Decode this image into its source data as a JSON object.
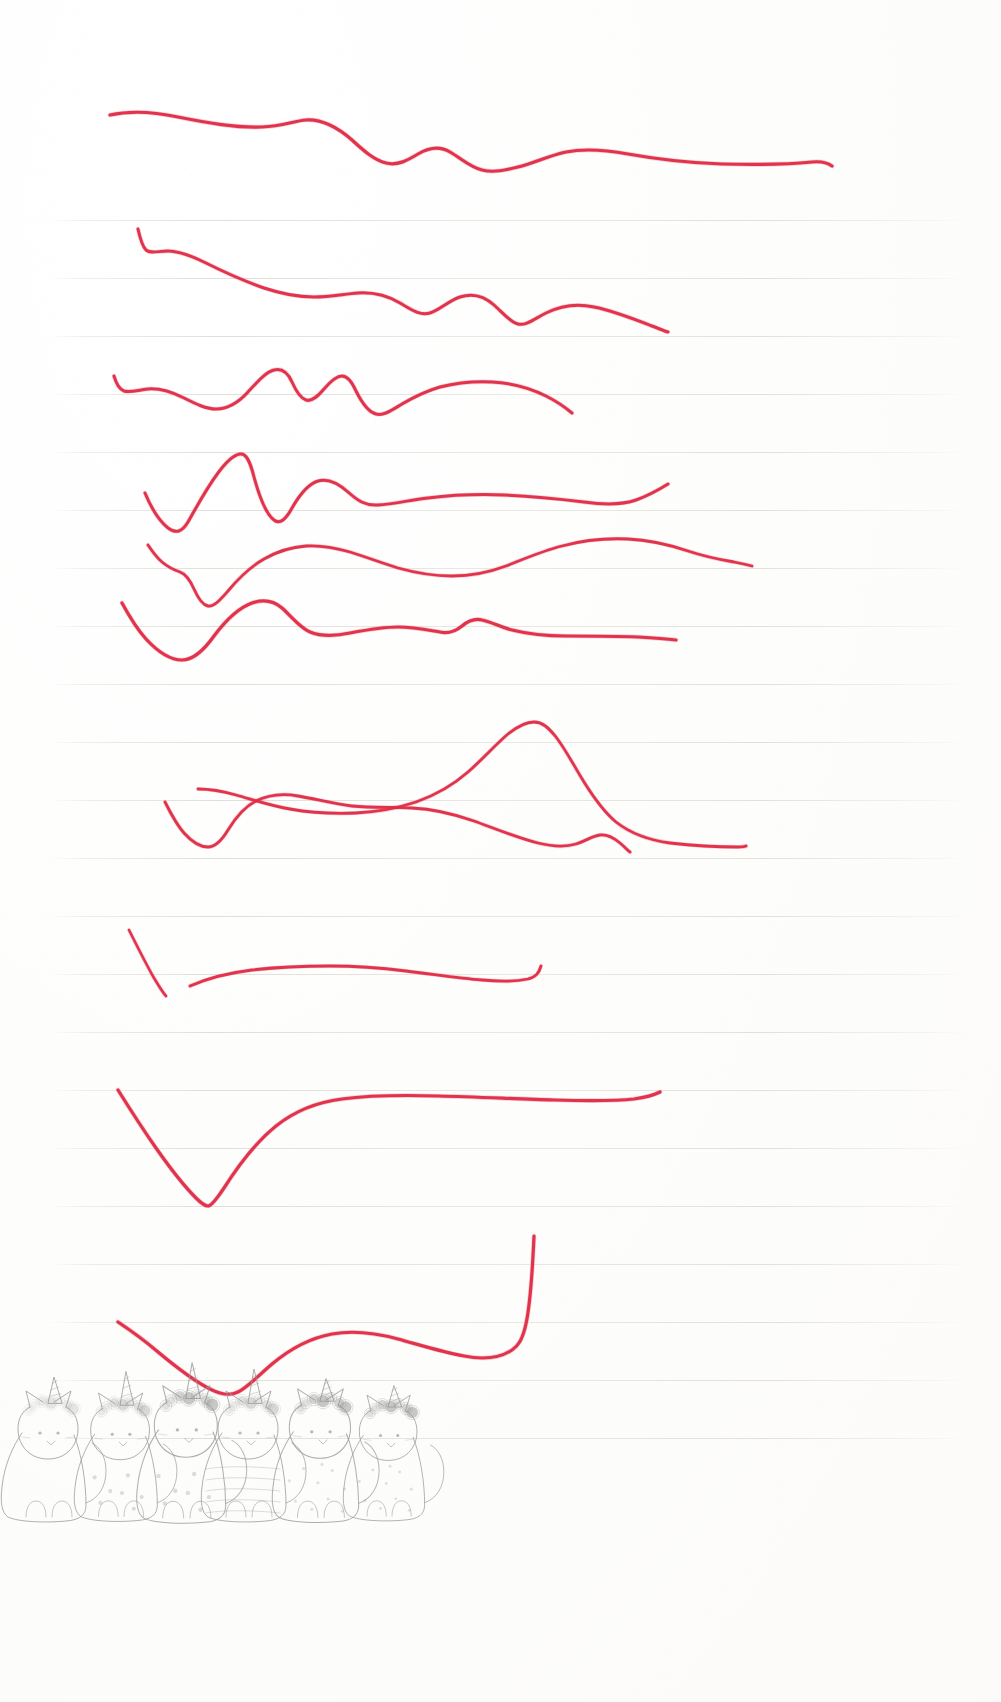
{
  "page": {
    "width": 1001,
    "height": 1702,
    "background_color": "#fefefe",
    "medium": "scanned lined notebook paper",
    "ink_color": "#e02a46",
    "ink_color_light": "#e8566c",
    "pencil_color": "#8e8e8e",
    "rule_color": "#c8c4b9"
  },
  "ruled_lines": {
    "count": 22,
    "first_y": 220,
    "spacing": 58,
    "left_margin": 52,
    "right_margin": 962,
    "color": "#c8c4b9"
  },
  "strokes": {
    "count": 12,
    "description": "Twelve freehand red ballpoint wave lines drawn left to right across the ruled page",
    "items": [
      {
        "id": 1,
        "name": "wave-stroke-1",
        "start_x": 110,
        "start_y": 114,
        "end_x": 832,
        "end_y": 166,
        "width": 3.2,
        "d": "M110,115 C128,111 150,111 178,117 C208,123 236,128 262,127 C282,126 294,121 306,120 C322,119 336,126 352,140 C364,151 374,160 386,163 C398,166 408,160 418,154 C430,147 440,146 450,152 C462,159 470,167 482,170 C494,173 506,170 518,167 C534,163 548,156 566,152 C586,148 606,150 628,154 C656,159 688,163 722,164 C756,165 790,164 812,162 C822,161 828,163 832,166"
      },
      {
        "id": 2,
        "name": "wave-stroke-2",
        "start_x": 138,
        "start_y": 229,
        "end_x": 668,
        "end_y": 332,
        "width": 3.0,
        "d": "M138,229 C140,238 142,246 146,250 C151,254 158,251 168,251 C180,251 192,256 206,263 C224,272 244,281 264,288 C282,294 298,297 314,297 C330,297 344,294 358,293 C374,292 388,296 400,303 C412,310 420,316 430,313 C440,310 448,301 460,297 C472,293 484,296 494,305 C504,314 510,322 518,324 C526,326 534,319 546,313 C560,306 576,303 594,307 C614,311 634,319 652,326 C660,329 664,331 668,332"
      },
      {
        "id": 3,
        "name": "wave-stroke-3",
        "start_x": 114,
        "start_y": 374,
        "end_x": 572,
        "end_y": 413,
        "width": 3.0,
        "d": "M114,376 C116,383 119,389 124,391 C130,393 138,390 148,389 C160,388 172,392 184,398 C196,404 206,409 216,409 C228,409 238,403 248,392 C258,381 266,372 274,370 C282,368 288,373 292,382 C296,391 300,398 306,400 C312,402 318,396 324,389 C330,382 336,376 342,376 C348,376 352,382 356,391 C362,403 368,412 376,414 C384,416 392,410 402,404 C414,397 426,391 440,387 C456,383 474,381 492,382 C512,383 530,388 546,396 C558,402 566,408 572,413"
      },
      {
        "id": 4,
        "name": "wave-stroke-4",
        "start_x": 145,
        "start_y": 493,
        "end_x": 668,
        "end_y": 484,
        "width": 3.0,
        "d": "M145,493 C150,505 158,520 168,528 C176,534 182,532 188,522 C196,508 206,489 218,473 C226,462 234,455 240,454 C246,453 250,461 254,477 C260,499 266,514 274,520 C280,525 286,519 292,508 C300,494 308,484 318,481 C328,478 338,483 348,492 C358,501 366,506 378,505 C394,504 410,500 428,498 C452,495 478,494 504,495 C532,496 560,499 584,502 C606,505 622,505 636,500 C650,495 660,489 668,484"
      },
      {
        "id": 5,
        "name": "wave-stroke-5",
        "start_x": 148,
        "start_y": 545,
        "end_x": 752,
        "end_y": 566,
        "width": 2.8,
        "d": "M148,545 C152,551 156,557 162,562 C168,567 174,570 180,572 C186,574 190,580 194,589 C198,598 202,605 208,606 C214,607 220,600 228,591 C238,579 250,567 264,559 C278,551 292,547 306,546 C322,545 336,548 350,552 C366,557 382,563 398,568 C416,573 434,576 452,576 C472,576 490,572 506,566 C524,559 542,551 562,546 C584,540 606,538 628,539 C650,540 670,545 688,551 C706,557 722,560 734,562 C744,564 748,565 752,566"
      },
      {
        "id": 6,
        "name": "wave-stroke-6",
        "start_x": 122,
        "start_y": 603,
        "end_x": 676,
        "end_y": 640,
        "width": 3.2,
        "d": "M122,603 C128,614 136,628 146,639 C158,652 170,660 182,660 C194,660 204,650 214,636 C226,620 238,608 252,603 C264,599 274,601 282,608 C292,617 300,628 310,632 C322,637 336,636 350,633 C366,630 382,627 398,627 C414,627 428,630 440,632 C450,634 456,631 462,626 C468,621 474,618 482,620 C492,622 500,627 512,630 C528,634 546,636 566,636 C590,636 614,636 638,637 C656,638 668,639 676,640"
      },
      {
        "id": 7,
        "name": "wave-stroke-7",
        "start_x": 198,
        "start_y": 789,
        "end_x": 746,
        "end_y": 846,
        "width": 2.8,
        "d": "M198,789 C210,789 222,791 236,795 C254,800 272,806 290,809 C312,813 334,814 356,813 C378,812 398,808 416,802 C436,795 452,786 468,772 C484,758 496,744 508,734 C518,726 526,722 534,722 C542,722 548,727 556,737 C566,750 574,766 584,782 C594,798 604,812 616,822 C630,833 648,840 670,843 C696,846 722,847 738,847 C744,847 746,846 746,846"
      },
      {
        "id": 8,
        "name": "wave-stroke-8",
        "start_x": 165,
        "start_y": 802,
        "end_x": 630,
        "end_y": 852,
        "width": 2.8,
        "d": "M165,802 C170,812 176,824 184,833 C192,842 200,847 208,847 C216,847 222,840 228,830 C236,817 244,807 256,801 C268,795 282,793 298,796 C316,799 334,804 352,806 C372,808 392,807 412,808 C434,809 454,814 474,821 C496,829 518,838 538,843 C554,847 566,847 576,844 C586,841 592,836 600,835 C608,834 614,838 620,843 C626,848 628,851 630,852"
      },
      {
        "id": 9,
        "name": "diagonal-tick-stroke-9",
        "start_x": 129,
        "start_y": 930,
        "end_x": 166,
        "end_y": 996,
        "width": 2.6,
        "d": "M129,930 C136,944 146,964 154,978 C160,988 164,994 166,996"
      },
      {
        "id": 10,
        "name": "flat-stroke-10",
        "start_x": 190,
        "start_y": 986,
        "end_x": 541,
        "end_y": 966,
        "width": 2.8,
        "d": "M190,986 C208,978 228,973 252,970 C278,967 304,966 330,966 C356,966 382,968 406,971 C432,974 458,978 482,980 C502,982 518,981 528,979 C536,977 539,973 541,966"
      },
      {
        "id": 11,
        "name": "deep-v-stroke-11",
        "start_x": 118,
        "start_y": 1090,
        "end_x": 660,
        "end_y": 1092,
        "width": 3.2,
        "d": "M118,1090 C128,1106 142,1128 156,1148 C170,1168 184,1186 196,1198 C202,1204 206,1206 208,1206 C211,1206 216,1200 224,1188 C238,1166 256,1142 276,1126 C296,1110 318,1102 342,1099 C372,1095 404,1095 438,1096 C478,1097 518,1099 554,1100 C588,1101 616,1101 634,1099 C648,1097 656,1094 660,1092"
      },
      {
        "id": 12,
        "name": "wave-stroke-12",
        "start_x": 118,
        "start_y": 1322,
        "end_x": 534,
        "end_y": 1236,
        "width": 3.2,
        "d": "M118,1322 C130,1330 144,1340 158,1352 C176,1367 194,1381 210,1389 C222,1395 230,1396 238,1392 C248,1387 258,1376 272,1364 C290,1349 310,1338 332,1334 C354,1330 376,1333 398,1339 C420,1345 442,1352 464,1356 C484,1360 500,1358 512,1350 C524,1342 530,1326 534,1236"
      }
    ]
  },
  "cats": {
    "title": "row-of-unicorn-cats",
    "description": "Six faint pencil-drawn seated cats with unicorn horns and flower crowns",
    "count": 6,
    "color": "#9a9a9a",
    "baseline_y": 1495,
    "items": [
      {
        "id": 1,
        "name": "cat-plain",
        "x": 52,
        "scale": 1.0,
        "pattern": "plain",
        "horn": "small",
        "crown": "light"
      },
      {
        "id": 2,
        "name": "cat-spotted",
        "x": 124,
        "scale": 0.98,
        "pattern": "spots",
        "horn": "tall",
        "crown": "medium"
      },
      {
        "id": 3,
        "name": "cat-spotted-2",
        "x": 190,
        "scale": 1.05,
        "pattern": "spots",
        "horn": "tall",
        "crown": "dark"
      },
      {
        "id": 4,
        "name": "cat-striped",
        "x": 252,
        "scale": 1.0,
        "pattern": "stripes",
        "horn": "tall",
        "crown": "medium"
      },
      {
        "id": 5,
        "name": "cat-dotted",
        "x": 324,
        "scale": 1.02,
        "pattern": "dots",
        "horn": "short",
        "crown": "dark"
      },
      {
        "id": 6,
        "name": "cat-dotted-2",
        "x": 392,
        "scale": 0.96,
        "pattern": "dots",
        "horn": "short",
        "crown": "dark"
      }
    ]
  }
}
